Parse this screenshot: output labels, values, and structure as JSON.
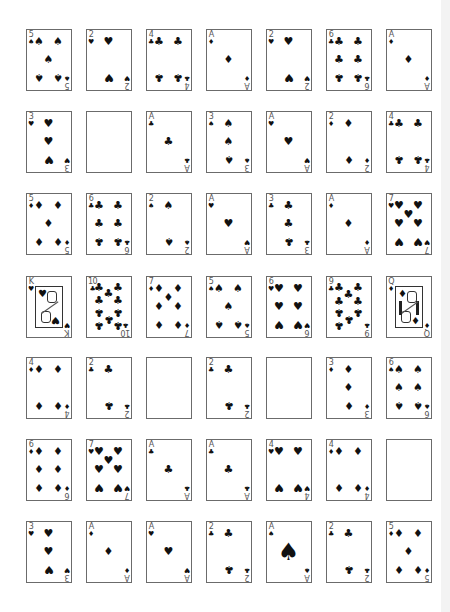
{
  "layout": {
    "columns_x": [
      26,
      86,
      146,
      206,
      266,
      326,
      386
    ],
    "rows_y": [
      29,
      111,
      193,
      276,
      357,
      439,
      521
    ]
  },
  "suit_glyphs": {
    "S": "♠",
    "H": "♥",
    "D": "♦",
    "C": "♣"
  },
  "rows": [
    [
      {
        "rank": "5",
        "suit": "S"
      },
      {
        "rank": "2",
        "suit": "H"
      },
      {
        "rank": "4",
        "suit": "C"
      },
      {
        "rank": "A",
        "suit": "D"
      },
      {
        "rank": "2",
        "suit": "H"
      },
      {
        "rank": "6",
        "suit": "C"
      },
      {
        "rank": "A",
        "suit": "D"
      }
    ],
    [
      {
        "rank": "3",
        "suit": "H"
      },
      {
        "rank": "",
        "suit": ""
      },
      {
        "rank": "A",
        "suit": "C"
      },
      {
        "rank": "3",
        "suit": "S"
      },
      {
        "rank": "A",
        "suit": "H"
      },
      {
        "rank": "2",
        "suit": "D"
      },
      {
        "rank": "4",
        "suit": "C"
      }
    ],
    [
      {
        "rank": "5",
        "suit": "D"
      },
      {
        "rank": "6",
        "suit": "C"
      },
      {
        "rank": "2",
        "suit": "S"
      },
      {
        "rank": "A",
        "suit": "H"
      },
      {
        "rank": "3",
        "suit": "C"
      },
      {
        "rank": "A",
        "suit": "D"
      },
      {
        "rank": "7",
        "suit": "H"
      }
    ],
    [
      {
        "rank": "K",
        "suit": "H"
      },
      {
        "rank": "10",
        "suit": "C"
      },
      {
        "rank": "7",
        "suit": "D"
      },
      {
        "rank": "5",
        "suit": "S"
      },
      {
        "rank": "6",
        "suit": "H"
      },
      {
        "rank": "9",
        "suit": "C"
      },
      {
        "rank": "Q",
        "suit": "D"
      }
    ],
    [
      {
        "rank": "4",
        "suit": "D"
      },
      {
        "rank": "2",
        "suit": "C"
      },
      {
        "rank": "",
        "suit": ""
      },
      {
        "rank": "2",
        "suit": "C"
      },
      {
        "rank": "",
        "suit": ""
      },
      {
        "rank": "3",
        "suit": "D"
      },
      {
        "rank": "6",
        "suit": "S"
      }
    ],
    [
      {
        "rank": "6",
        "suit": "D"
      },
      {
        "rank": "7",
        "suit": "H"
      },
      {
        "rank": "A",
        "suit": "C"
      },
      {
        "rank": "A",
        "suit": "C"
      },
      {
        "rank": "4",
        "suit": "H"
      },
      {
        "rank": "4",
        "suit": "D"
      },
      {
        "rank": "",
        "suit": ""
      }
    ],
    [
      {
        "rank": "3",
        "suit": "H"
      },
      {
        "rank": "A",
        "suit": "D"
      },
      {
        "rank": "A",
        "suit": "H"
      },
      {
        "rank": "2",
        "suit": "C"
      },
      {
        "rank": "A",
        "suit": "S"
      },
      {
        "rank": "2",
        "suit": "C"
      },
      {
        "rank": "5",
        "suit": "D"
      }
    ]
  ]
}
